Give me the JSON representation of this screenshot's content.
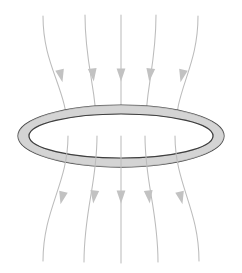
{
  "figure": {
    "background_color": "#ffffff",
    "width": 242,
    "height": 273
  },
  "ring": {
    "name": "conducting-ring",
    "description": "Circular loop drawn in perspective as a flat ellipse with tube thickness",
    "center_x": 121,
    "center_y": 136,
    "outer_rx": 103,
    "outer_ry": 31,
    "inner_rx": 92,
    "inner_ry": 22,
    "fill_color": "#e3e3e3",
    "outline_color": "#4a4a4a",
    "shade_color": "#cfcfcf"
  },
  "field": {
    "name": "magnetic-field-lines",
    "direction": "downward",
    "line_color": "#bcbcbc",
    "arrow_color": "#c2c2c2",
    "line_count": 5,
    "arrow_count": 10,
    "lines": [
      {
        "id": "field-line-1",
        "top_x": 43,
        "mid_x": 68,
        "bottom_x": 43,
        "top_y": 16,
        "bottom_y": 261
      },
      {
        "id": "field-line-2",
        "top_x": 85,
        "mid_x": 97,
        "bottom_x": 84,
        "top_y": 15,
        "bottom_y": 262
      },
      {
        "id": "field-line-3",
        "top_x": 121,
        "mid_x": 121,
        "bottom_x": 121,
        "top_y": 15,
        "bottom_y": 263
      },
      {
        "id": "field-line-4",
        "top_x": 156,
        "mid_x": 145,
        "bottom_x": 158,
        "top_y": 15,
        "bottom_y": 262
      },
      {
        "id": "field-line-5",
        "top_x": 198,
        "mid_x": 175,
        "bottom_x": 199,
        "top_y": 16,
        "bottom_y": 261
      }
    ],
    "upper_arrows": [
      {
        "id": "field-arrow-upper-1",
        "x": 61,
        "y": 76,
        "angle": -13
      },
      {
        "id": "field-arrow-upper-2",
        "x": 93,
        "y": 75,
        "angle": -7
      },
      {
        "id": "field-arrow-upper-3",
        "x": 121,
        "y": 75,
        "angle": 0
      },
      {
        "id": "field-arrow-upper-4",
        "x": 150,
        "y": 75,
        "angle": 7
      },
      {
        "id": "field-arrow-upper-5",
        "x": 182,
        "y": 76,
        "angle": 13
      }
    ],
    "lower_arrows": [
      {
        "id": "field-arrow-lower-1",
        "x": 62,
        "y": 198,
        "angle": 13
      },
      {
        "id": "field-arrow-lower-2",
        "x": 94,
        "y": 197,
        "angle": 7
      },
      {
        "id": "field-arrow-lower-3",
        "x": 121,
        "y": 197,
        "angle": 0
      },
      {
        "id": "field-arrow-lower-4",
        "x": 149,
        "y": 197,
        "angle": -7
      },
      {
        "id": "field-arrow-lower-5",
        "x": 181,
        "y": 198,
        "angle": -13
      }
    ]
  }
}
